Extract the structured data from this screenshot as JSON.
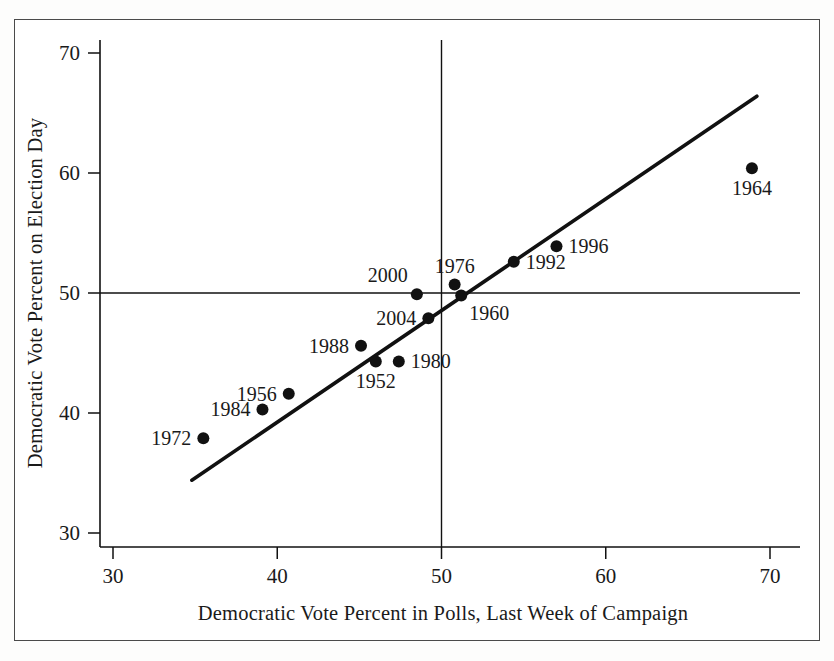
{
  "chart_data": {
    "type": "scatter",
    "title": "",
    "xlabel": "Democratic Vote Percent in Polls, Last Week of Campaign",
    "ylabel": "Democratic Vote Percent on Election Day",
    "xlim": [
      28.5,
      71.5
    ],
    "ylim": [
      28.5,
      71.5
    ],
    "xticks": [
      30,
      40,
      50,
      60,
      70
    ],
    "yticks": [
      30,
      40,
      50,
      60,
      70
    ],
    "xtick_labels": [
      "30",
      "40",
      "50",
      "60",
      "70"
    ],
    "ytick_labels": [
      "30",
      "40",
      "50",
      "60",
      "70"
    ],
    "grid": false,
    "legend": "none",
    "reference_lines": [
      {
        "name": "x-50-vertical",
        "orientation": "vertical",
        "value": 50
      },
      {
        "name": "y-50-horizontal",
        "orientation": "horizontal",
        "value": 50
      }
    ],
    "fit_line": {
      "name": "regression-line",
      "x_start": 34.8,
      "y_start": 34.4,
      "x_end": 69.2,
      "y_end": 66.4
    },
    "points": [
      {
        "label": "1972",
        "x": 35.5,
        "y": 37.9,
        "label_pos": "left"
      },
      {
        "label": "1984",
        "x": 39.1,
        "y": 40.3,
        "label_pos": "left"
      },
      {
        "label": "1956",
        "x": 40.7,
        "y": 41.6,
        "label_pos": "left"
      },
      {
        "label": "1988",
        "x": 45.1,
        "y": 45.6,
        "label_pos": "left"
      },
      {
        "label": "1952",
        "x": 46.0,
        "y": 44.3,
        "label_pos": "below"
      },
      {
        "label": "1980",
        "x": 47.4,
        "y": 44.3,
        "label_pos": "right"
      },
      {
        "label": "2000",
        "x": 48.5,
        "y": 49.9,
        "label_pos": "above-left"
      },
      {
        "label": "2004",
        "x": 49.2,
        "y": 47.9,
        "label_pos": "left"
      },
      {
        "label": "1976",
        "x": 50.8,
        "y": 50.7,
        "label_pos": "above"
      },
      {
        "label": "1960",
        "x": 51.2,
        "y": 49.8,
        "label_pos": "below-right"
      },
      {
        "label": "1992",
        "x": 54.4,
        "y": 52.6,
        "label_pos": "right"
      },
      {
        "label": "1996",
        "x": 57.0,
        "y": 53.9,
        "label_pos": "right"
      },
      {
        "label": "1964",
        "x": 68.9,
        "y": 60.4,
        "label_pos": "below"
      }
    ]
  }
}
